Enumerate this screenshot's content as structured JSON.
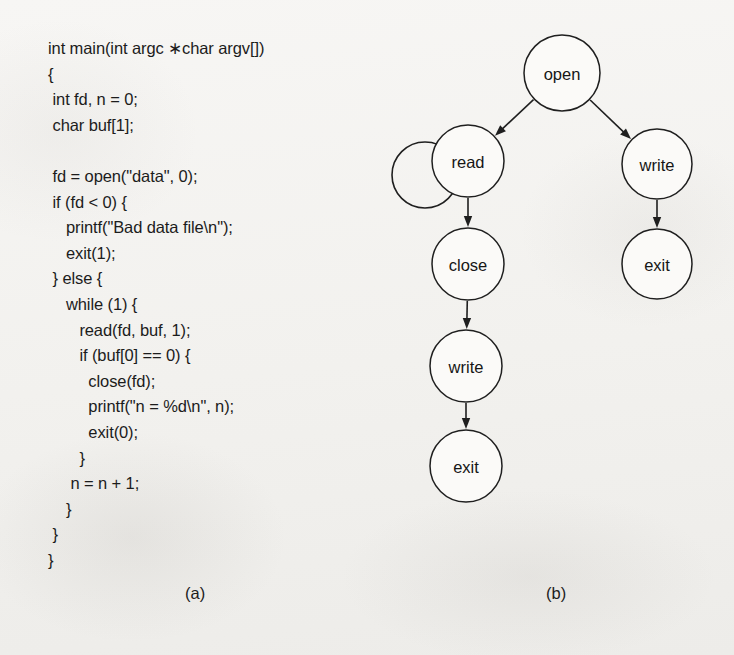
{
  "figure": {
    "panel_a_label": "(a)",
    "panel_b_label": "(b)"
  },
  "code": {
    "language": "c",
    "lines": [
      "int main(int argc ∗char argv[])",
      "{",
      " int fd, n = 0;",
      " char buf[1];",
      "",
      " fd = open(\"data\", 0);",
      " if (fd < 0) {",
      "    printf(\"Bad data file\\n\");",
      "    exit(1);",
      " } else {",
      "    while (1) {",
      "       read(fd, buf, 1);",
      "       if (buf[0] == 0) {",
      "         close(fd);",
      "         printf(\"n = %d\\n\", n);",
      "         exit(0);",
      "       }",
      "     n = n + 1;",
      "    }",
      " }",
      "}"
    ]
  },
  "graph": {
    "nodes": [
      {
        "id": "open",
        "label": "open",
        "cx": 190,
        "cy": 73,
        "r": 38
      },
      {
        "id": "read",
        "label": "read",
        "cx": 96,
        "cy": 161,
        "r": 36
      },
      {
        "id": "write-right",
        "label": "write",
        "cx": 285,
        "cy": 164,
        "r": 35
      },
      {
        "id": "close",
        "label": "close",
        "cx": 96,
        "cy": 264,
        "r": 36
      },
      {
        "id": "exit-right",
        "label": "exit",
        "cx": 285,
        "cy": 264,
        "r": 35
      },
      {
        "id": "write-left",
        "label": "write",
        "cx": 94,
        "cy": 366,
        "r": 36
      },
      {
        "id": "exit-left",
        "label": "exit",
        "cx": 94,
        "cy": 466,
        "r": 36
      }
    ],
    "edges": [
      {
        "from": "open",
        "to": "read"
      },
      {
        "from": "open",
        "to": "write-right"
      },
      {
        "from": "read",
        "to": "read",
        "self_loop": true
      },
      {
        "from": "read",
        "to": "close"
      },
      {
        "from": "write-right",
        "to": "exit-right"
      },
      {
        "from": "close",
        "to": "write-left"
      },
      {
        "from": "write-left",
        "to": "exit-left"
      }
    ]
  },
  "colors": {
    "page_background": "#f4f3f1",
    "ink": "#1c1c1c",
    "node_fill": "#fbfaf8",
    "node_stroke": "#1f1f1f"
  }
}
